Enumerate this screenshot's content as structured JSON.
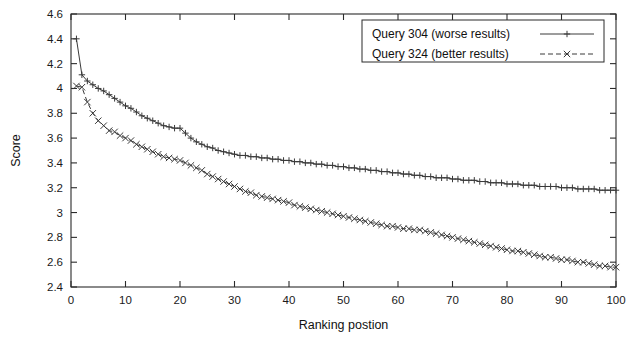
{
  "chart_data": {
    "type": "line",
    "title": "",
    "xlabel": "Ranking postion",
    "ylabel": "Score",
    "xlim": [
      0,
      100
    ],
    "ylim": [
      2.4,
      4.6
    ],
    "grid": false,
    "legend_position": "top-right",
    "xticks": [
      "0",
      "10",
      "20",
      "30",
      "40",
      "50",
      "60",
      "70",
      "80",
      "90",
      "100"
    ],
    "yticks": [
      "2.4",
      "2.6",
      "2.8",
      "3",
      "3.2",
      "3.4",
      "3.6",
      "3.8",
      "4",
      "4.2",
      "4.4",
      "4.6"
    ],
    "series": [
      {
        "name": "Query 304 (worse results)",
        "marker": "plus",
        "dash": "solid",
        "x": [
          1,
          2,
          3,
          4,
          5,
          6,
          7,
          8,
          9,
          10,
          11,
          12,
          13,
          14,
          15,
          16,
          17,
          18,
          19,
          20,
          21,
          22,
          23,
          24,
          25,
          26,
          27,
          28,
          29,
          30,
          31,
          32,
          33,
          34,
          35,
          36,
          37,
          38,
          39,
          40,
          41,
          42,
          43,
          44,
          45,
          46,
          47,
          48,
          49,
          50,
          51,
          52,
          53,
          54,
          55,
          56,
          57,
          58,
          59,
          60,
          61,
          62,
          63,
          64,
          65,
          66,
          67,
          68,
          69,
          70,
          71,
          72,
          73,
          74,
          75,
          76,
          77,
          78,
          79,
          80,
          81,
          82,
          83,
          84,
          85,
          86,
          87,
          88,
          89,
          90,
          91,
          92,
          93,
          94,
          95,
          96,
          97,
          98,
          99,
          100
        ],
        "values": [
          4.4,
          4.11,
          4.06,
          4.03,
          4.0,
          3.98,
          3.95,
          3.92,
          3.89,
          3.86,
          3.84,
          3.81,
          3.78,
          3.76,
          3.74,
          3.72,
          3.7,
          3.69,
          3.68,
          3.68,
          3.64,
          3.6,
          3.57,
          3.55,
          3.53,
          3.52,
          3.5,
          3.49,
          3.48,
          3.47,
          3.46,
          3.46,
          3.45,
          3.45,
          3.44,
          3.44,
          3.43,
          3.43,
          3.42,
          3.42,
          3.41,
          3.41,
          3.4,
          3.4,
          3.39,
          3.39,
          3.38,
          3.38,
          3.37,
          3.37,
          3.36,
          3.36,
          3.35,
          3.35,
          3.34,
          3.34,
          3.33,
          3.33,
          3.32,
          3.32,
          3.31,
          3.31,
          3.3,
          3.3,
          3.29,
          3.29,
          3.28,
          3.28,
          3.28,
          3.27,
          3.27,
          3.26,
          3.26,
          3.26,
          3.25,
          3.25,
          3.24,
          3.24,
          3.24,
          3.23,
          3.23,
          3.23,
          3.22,
          3.22,
          3.22,
          3.21,
          3.21,
          3.21,
          3.21,
          3.2,
          3.2,
          3.2,
          3.19,
          3.19,
          3.19,
          3.19,
          3.18,
          3.18,
          3.18,
          3.18
        ]
      },
      {
        "name": "Query 324 (better results)",
        "marker": "cross",
        "dash": "dashed",
        "x": [
          1,
          2,
          3,
          4,
          5,
          6,
          7,
          8,
          9,
          10,
          11,
          12,
          13,
          14,
          15,
          16,
          17,
          18,
          19,
          20,
          21,
          22,
          23,
          24,
          25,
          26,
          27,
          28,
          29,
          30,
          31,
          32,
          33,
          34,
          35,
          36,
          37,
          38,
          39,
          40,
          41,
          42,
          43,
          44,
          45,
          46,
          47,
          48,
          49,
          50,
          51,
          52,
          53,
          54,
          55,
          56,
          57,
          58,
          59,
          60,
          61,
          62,
          63,
          64,
          65,
          66,
          67,
          68,
          69,
          70,
          71,
          72,
          73,
          74,
          75,
          76,
          77,
          78,
          79,
          80,
          81,
          82,
          83,
          84,
          85,
          86,
          87,
          88,
          89,
          90,
          91,
          92,
          93,
          94,
          95,
          96,
          97,
          98,
          99,
          100
        ],
        "values": [
          4.02,
          4.01,
          3.89,
          3.8,
          3.74,
          3.7,
          3.66,
          3.65,
          3.62,
          3.6,
          3.58,
          3.55,
          3.53,
          3.51,
          3.49,
          3.47,
          3.45,
          3.44,
          3.43,
          3.42,
          3.4,
          3.38,
          3.36,
          3.34,
          3.31,
          3.29,
          3.27,
          3.25,
          3.23,
          3.21,
          3.19,
          3.17,
          3.16,
          3.14,
          3.13,
          3.12,
          3.11,
          3.1,
          3.09,
          3.08,
          3.06,
          3.05,
          3.04,
          3.03,
          3.02,
          3.01,
          3.0,
          2.99,
          2.98,
          2.97,
          2.96,
          2.95,
          2.94,
          2.93,
          2.92,
          2.91,
          2.9,
          2.89,
          2.89,
          2.88,
          2.87,
          2.87,
          2.86,
          2.86,
          2.85,
          2.84,
          2.83,
          2.82,
          2.81,
          2.8,
          2.79,
          2.78,
          2.77,
          2.76,
          2.75,
          2.74,
          2.73,
          2.72,
          2.71,
          2.7,
          2.69,
          2.69,
          2.68,
          2.67,
          2.66,
          2.65,
          2.64,
          2.64,
          2.63,
          2.62,
          2.62,
          2.61,
          2.6,
          2.6,
          2.59,
          2.58,
          2.57,
          2.57,
          2.56,
          2.56
        ]
      }
    ]
  },
  "legend": {
    "entries": [
      {
        "label": "Query 304 (worse results)"
      },
      {
        "label": "Query 324 (better results)"
      }
    ]
  }
}
